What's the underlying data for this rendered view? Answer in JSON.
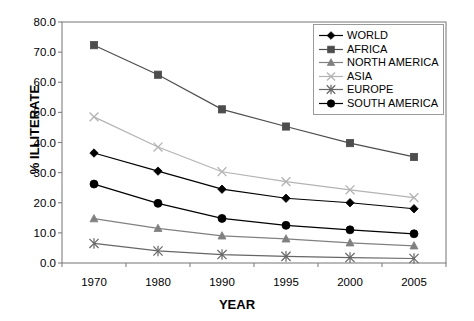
{
  "chart_data": {
    "type": "line",
    "title": "",
    "xlabel": "YEAR",
    "ylabel": "% ILLITERATE",
    "categories": [
      "1970",
      "1980",
      "1990",
      "1995",
      "2000",
      "2005"
    ],
    "x": [
      1970,
      1980,
      1990,
      1995,
      2000,
      2005
    ],
    "ylim": [
      0.0,
      80.0
    ],
    "yticks": [
      "0.0",
      "10.0",
      "20.0",
      "30.0",
      "40.0",
      "50.0",
      "60.0",
      "70.0",
      "80.0"
    ],
    "ytick_values": [
      0.0,
      10.0,
      20.0,
      30.0,
      40.0,
      50.0,
      60.0,
      70.0,
      80.0
    ],
    "grid": false,
    "legend_position": "top-right",
    "series": [
      {
        "name": "WORLD",
        "marker": "diamond",
        "color": "#000000",
        "values": [
          36.5,
          30.5,
          24.5,
          21.5,
          20.0,
          18.0
        ]
      },
      {
        "name": "AFRICA",
        "marker": "square",
        "color": "#4d4d4d",
        "values": [
          72.3,
          62.5,
          51.0,
          45.3,
          39.8,
          35.2
        ]
      },
      {
        "name": "NORTH AMERICA",
        "marker": "triangle",
        "color": "#808080",
        "values": [
          14.7,
          11.5,
          9.0,
          8.0,
          6.7,
          5.7
        ]
      },
      {
        "name": "ASIA",
        "marker": "x",
        "color": "#b3b3b3",
        "values": [
          48.5,
          38.5,
          30.3,
          27.0,
          24.3,
          21.7
        ]
      },
      {
        "name": "EUROPE",
        "marker": "asterisk",
        "color": "#666666",
        "values": [
          6.5,
          4.0,
          2.8,
          2.2,
          1.8,
          1.5
        ]
      },
      {
        "name": "SOUTH AMERICA",
        "marker": "circle",
        "color": "#000000",
        "values": [
          26.2,
          19.8,
          14.8,
          12.5,
          11.0,
          9.7
        ]
      }
    ]
  },
  "axes": {
    "y_title": "% ILLITERATE",
    "x_title": "YEAR"
  },
  "colors": {
    "frame": "#808080",
    "text": "#000000",
    "background": "#ffffff"
  },
  "bottom_caption": ""
}
